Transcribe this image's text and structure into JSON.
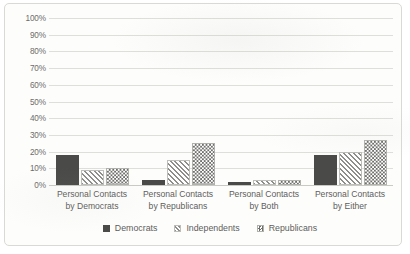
{
  "chart_data": {
    "type": "bar",
    "title": "",
    "subtitle": "",
    "xlabel": "",
    "ylabel": "",
    "ylim": [
      0,
      100
    ],
    "grid": "horizontal",
    "legend_position": "bottom",
    "y_ticks": [
      "0%",
      "10%",
      "20%",
      "30%",
      "40%",
      "50%",
      "60%",
      "70%",
      "80%",
      "90%",
      "100%"
    ],
    "y_tick_values": [
      0,
      10,
      20,
      30,
      40,
      50,
      60,
      70,
      80,
      90,
      100
    ],
    "categories": [
      "Personal Contacts by Democrats",
      "Personal Contacts by Republicans",
      "Personal Contacts by Both",
      "Personal Contacts by Either"
    ],
    "category_lines": [
      [
        "Personal Contacts",
        "by Democrats"
      ],
      [
        "Personal Contacts",
        "by Republicans"
      ],
      [
        "Personal Contacts",
        "by Both"
      ],
      [
        "Personal Contacts",
        "by Either"
      ]
    ],
    "series": [
      {
        "name": "Democrats",
        "pattern": "solid",
        "color": "#4a4a48",
        "values": [
          18,
          3,
          2,
          18
        ]
      },
      {
        "name": "Independents",
        "pattern": "diagonal-hatch",
        "color": "#8e8e8a",
        "values": [
          9,
          15,
          3,
          20
        ]
      },
      {
        "name": "Republicans",
        "pattern": "checkerboard",
        "color": "#6f6f6c",
        "values": [
          10,
          25,
          3,
          27
        ]
      }
    ]
  },
  "legend": {
    "items": [
      {
        "label": "Democrats"
      },
      {
        "label": "Independents"
      },
      {
        "label": "Republicans"
      }
    ]
  }
}
